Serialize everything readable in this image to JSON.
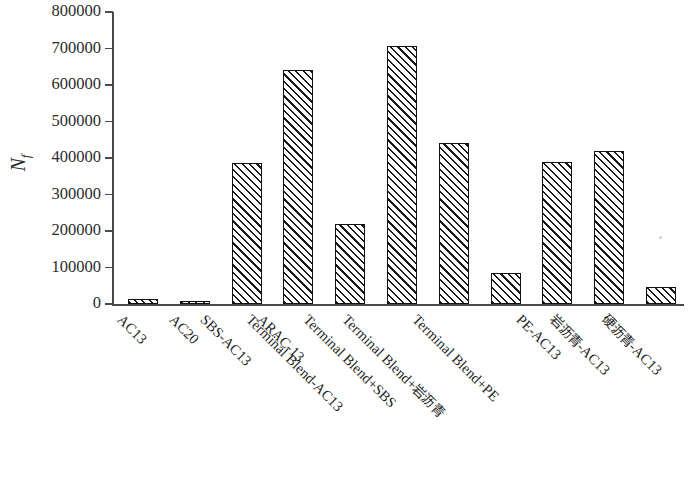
{
  "chart_data": {
    "type": "bar",
    "title": "",
    "subtitle": "",
    "xlabel": "",
    "ylabel": "N_f",
    "ylabel_base": "N",
    "ylabel_sub": "f",
    "ylim": [
      0,
      800000
    ],
    "ytick_values": [
      800000,
      700000,
      600000,
      500000,
      400000,
      300000,
      200000,
      100000,
      0
    ],
    "ytick_labels": [
      "800000",
      "700000",
      "600000",
      "500000",
      "400000",
      "300000",
      "200000",
      "100000",
      "0"
    ],
    "grid": false,
    "legend": null,
    "bar_style": {
      "fill": "#ffffff",
      "hatch": "/",
      "hatch_color": "#1a1a1a",
      "edge_color": "#111111"
    },
    "axis_color": "#4a4a4a",
    "categories": [
      "AC13",
      "AC20",
      "SBS-AC13",
      "ARAC-13",
      "Terminal Blend-AC13",
      "Terminal Blend+SBS",
      "Terminal Blend+岩沥青",
      "Terminal Blend+PE",
      "PE-AC13",
      "岩沥青-AC13",
      "硬沥青-AC13"
    ],
    "values": [
      14000,
      7000,
      387000,
      640000,
      218000,
      708000,
      441000,
      86000,
      389000,
      419000,
      47000
    ]
  },
  "axis": {
    "y_title_base": "N",
    "y_title_sub": "f"
  }
}
